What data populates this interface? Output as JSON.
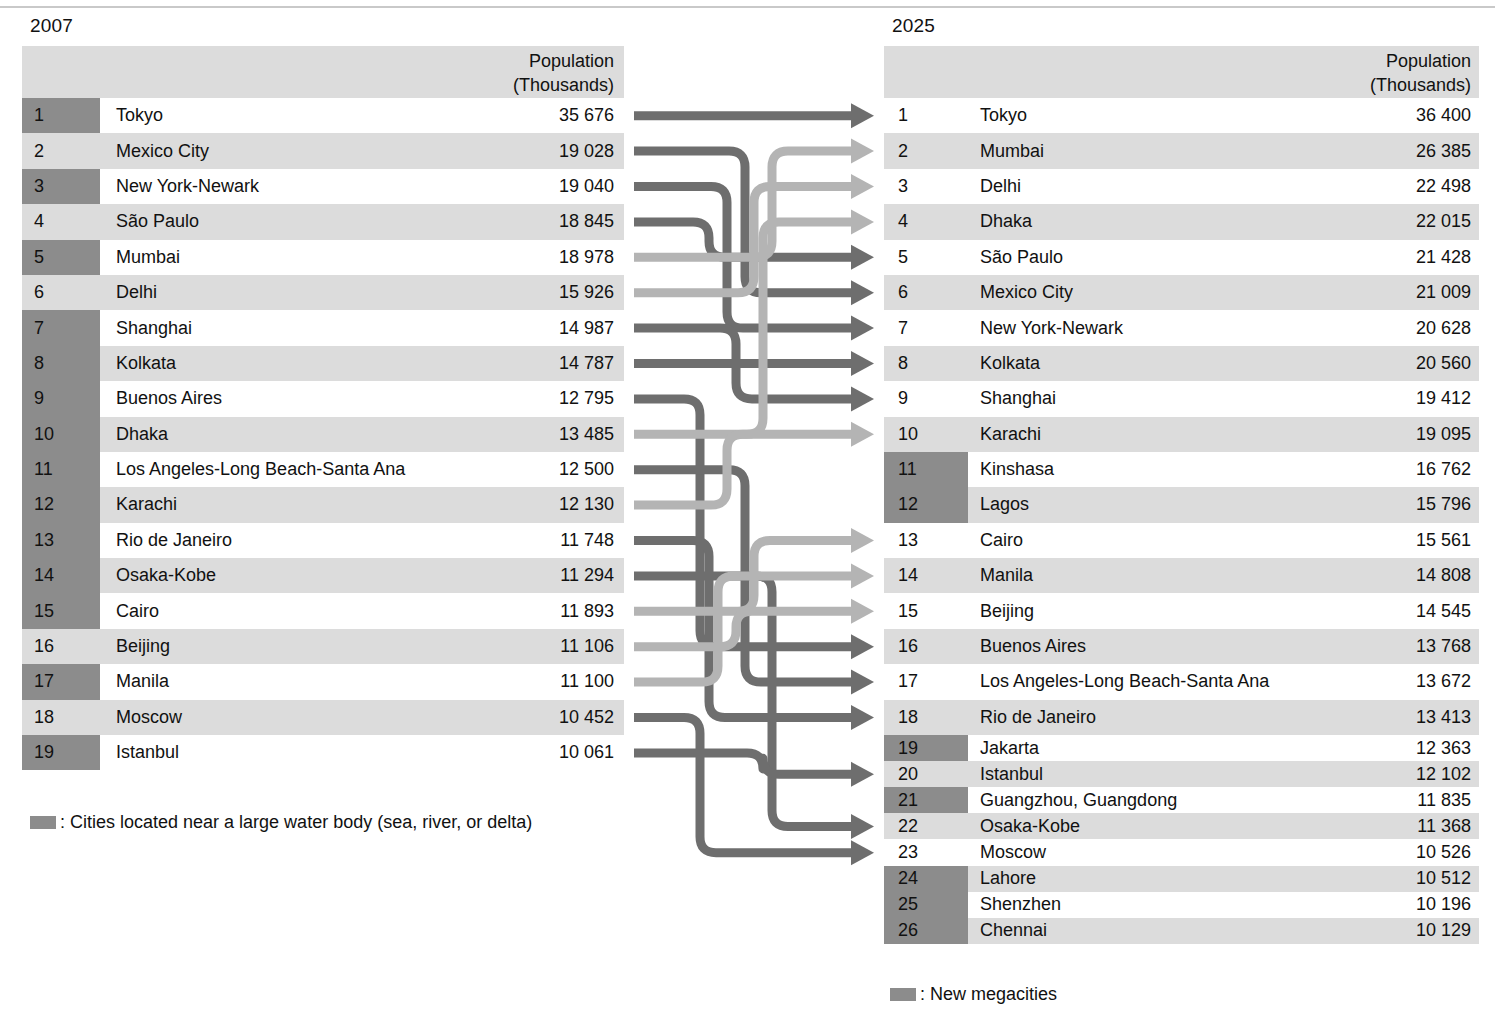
{
  "years": {
    "left": "2007",
    "right": "2025"
  },
  "headers": {
    "population_line1": "Population",
    "population_line2": "(Thousands)"
  },
  "colors": {
    "badge_shaded": "#8c8c8c",
    "row_even": "#dcdcdc",
    "row_odd": "#ffffff",
    "header_band": "#dcdcdc",
    "flow_dark": "#6e6e6e",
    "flow_light": "#b4b4b4",
    "rule": "#c9c9c9",
    "text": "#1a1a1a"
  },
  "legends": {
    "left": ": Cities located near a large water body (sea, river, or delta)",
    "right": ": New megacities"
  },
  "chart_data": {
    "type": "table",
    "title": "",
    "subtitle": "",
    "columns": [
      "Rank",
      "City",
      "Population (Thousands)"
    ],
    "left": {
      "year": "2007",
      "rows": [
        {
          "rank": "1",
          "city": "Tokyo",
          "pop": "35 676",
          "value": 35676,
          "shaded": true
        },
        {
          "rank": "2",
          "city": "Mexico City",
          "pop": "19 028",
          "value": 19028,
          "shaded": false
        },
        {
          "rank": "3",
          "city": "New York-Newark",
          "pop": "19 040",
          "value": 19040,
          "shaded": true
        },
        {
          "rank": "4",
          "city": "São Paulo",
          "pop": "18 845",
          "value": 18845,
          "shaded": false
        },
        {
          "rank": "5",
          "city": "Mumbai",
          "pop": "18 978",
          "value": 18978,
          "shaded": true
        },
        {
          "rank": "6",
          "city": "Delhi",
          "pop": "15 926",
          "value": 15926,
          "shaded": false
        },
        {
          "rank": "7",
          "city": "Shanghai",
          "pop": "14 987",
          "value": 14987,
          "shaded": true
        },
        {
          "rank": "8",
          "city": "Kolkata",
          "pop": "14 787",
          "value": 14787,
          "shaded": true
        },
        {
          "rank": "9",
          "city": "Buenos Aires",
          "pop": "12 795",
          "value": 12795,
          "shaded": true
        },
        {
          "rank": "10",
          "city": "Dhaka",
          "pop": "13 485",
          "value": 13485,
          "shaded": true
        },
        {
          "rank": "11",
          "city": "Los Angeles-Long Beach-Santa Ana",
          "pop": "12 500",
          "value": 12500,
          "shaded": true
        },
        {
          "rank": "12",
          "city": "Karachi",
          "pop": "12 130",
          "value": 12130,
          "shaded": true
        },
        {
          "rank": "13",
          "city": "Rio de Janeiro",
          "pop": "11 748",
          "value": 11748,
          "shaded": true
        },
        {
          "rank": "14",
          "city": "Osaka-Kobe",
          "pop": "11 294",
          "value": 11294,
          "shaded": true
        },
        {
          "rank": "15",
          "city": "Cairo",
          "pop": "11 893",
          "value": 11893,
          "shaded": true
        },
        {
          "rank": "16",
          "city": "Beijing",
          "pop": "11 106",
          "value": 11106,
          "shaded": false
        },
        {
          "rank": "17",
          "city": "Manila",
          "pop": "11 100",
          "value": 11100,
          "shaded": true
        },
        {
          "rank": "18",
          "city": "Moscow",
          "pop": "10 452",
          "value": 10452,
          "shaded": false
        },
        {
          "rank": "19",
          "city": "Istanbul",
          "pop": "10 061",
          "value": 10061,
          "shaded": true
        }
      ]
    },
    "right": {
      "year": "2025",
      "rows": [
        {
          "rank": "1",
          "city": "Tokyo",
          "pop": "36 400",
          "value": 36400,
          "shaded": false
        },
        {
          "rank": "2",
          "city": "Mumbai",
          "pop": "26 385",
          "value": 26385,
          "shaded": false
        },
        {
          "rank": "3",
          "city": "Delhi",
          "pop": "22 498",
          "value": 22498,
          "shaded": false
        },
        {
          "rank": "4",
          "city": "Dhaka",
          "pop": "22 015",
          "value": 22015,
          "shaded": false
        },
        {
          "rank": "5",
          "city": "São Paulo",
          "pop": "21 428",
          "value": 21428,
          "shaded": false
        },
        {
          "rank": "6",
          "city": "Mexico City",
          "pop": "21 009",
          "value": 21009,
          "shaded": false
        },
        {
          "rank": "7",
          "city": "New York-Newark",
          "pop": "20 628",
          "value": 20628,
          "shaded": false
        },
        {
          "rank": "8",
          "city": "Kolkata",
          "pop": "20 560",
          "value": 20560,
          "shaded": false
        },
        {
          "rank": "9",
          "city": "Shanghai",
          "pop": "19 412",
          "value": 19412,
          "shaded": false
        },
        {
          "rank": "10",
          "city": "Karachi",
          "pop": "19 095",
          "value": 19095,
          "shaded": false
        },
        {
          "rank": "11",
          "city": "Kinshasa",
          "pop": "16 762",
          "value": 16762,
          "shaded": true
        },
        {
          "rank": "12",
          "city": "Lagos",
          "pop": "15 796",
          "value": 15796,
          "shaded": true
        },
        {
          "rank": "13",
          "city": "Cairo",
          "pop": "15 561",
          "value": 15561,
          "shaded": false
        },
        {
          "rank": "14",
          "city": "Manila",
          "pop": "14 808",
          "value": 14808,
          "shaded": false
        },
        {
          "rank": "15",
          "city": "Beijing",
          "pop": "14 545",
          "value": 14545,
          "shaded": false
        },
        {
          "rank": "16",
          "city": "Buenos Aires",
          "pop": "13 768",
          "value": 13768,
          "shaded": false
        },
        {
          "rank": "17",
          "city": "Los Angeles-Long Beach-Santa Ana",
          "pop": "13 672",
          "value": 13672,
          "shaded": false
        },
        {
          "rank": "18",
          "city": "Rio de Janeiro",
          "pop": "13 413",
          "value": 13413,
          "shaded": false
        },
        {
          "rank": "19",
          "city": "Jakarta",
          "pop": "12 363",
          "value": 12363,
          "shaded": true
        },
        {
          "rank": "20",
          "city": "Istanbul",
          "pop": "12 102",
          "value": 12102,
          "shaded": false
        },
        {
          "rank": "21",
          "city": "Guangzhou, Guangdong",
          "pop": "11 835",
          "value": 11835,
          "shaded": true
        },
        {
          "rank": "22",
          "city": "Osaka-Kobe",
          "pop": "11 368",
          "value": 11368,
          "shaded": false
        },
        {
          "rank": "23",
          "city": "Moscow",
          "pop": "10 526",
          "value": 10526,
          "shaded": false
        },
        {
          "rank": "24",
          "city": "Lahore",
          "pop": "10 512",
          "value": 10512,
          "shaded": true
        },
        {
          "rank": "25",
          "city": "Shenzhen",
          "pop": "10 196",
          "value": 10196,
          "shaded": true
        },
        {
          "rank": "26",
          "city": "Chennai",
          "pop": "10 129",
          "value": 10129,
          "shaded": true
        }
      ]
    },
    "links": [
      {
        "from": "Tokyo",
        "from_rank": 1,
        "to_rank": 1,
        "shade": "dark"
      },
      {
        "from": "Mexico City",
        "from_rank": 2,
        "to_rank": 6,
        "shade": "dark"
      },
      {
        "from": "New York-Newark",
        "from_rank": 3,
        "to_rank": 7,
        "shade": "dark"
      },
      {
        "from": "São Paulo",
        "from_rank": 4,
        "to_rank": 5,
        "shade": "dark"
      },
      {
        "from": "Mumbai",
        "from_rank": 5,
        "to_rank": 2,
        "shade": "light"
      },
      {
        "from": "Delhi",
        "from_rank": 6,
        "to_rank": 3,
        "shade": "light"
      },
      {
        "from": "Shanghai",
        "from_rank": 7,
        "to_rank": 9,
        "shade": "dark"
      },
      {
        "from": "Kolkata",
        "from_rank": 8,
        "to_rank": 8,
        "shade": "dark"
      },
      {
        "from": "Buenos Aires",
        "from_rank": 9,
        "to_rank": 16,
        "shade": "dark"
      },
      {
        "from": "Dhaka",
        "from_rank": 10,
        "to_rank": 4,
        "shade": "light"
      },
      {
        "from": "Los Angeles-Long Beach-Santa Ana",
        "from_rank": 11,
        "to_rank": 17,
        "shade": "dark"
      },
      {
        "from": "Karachi",
        "from_rank": 12,
        "to_rank": 10,
        "shade": "light"
      },
      {
        "from": "Rio de Janeiro",
        "from_rank": 13,
        "to_rank": 18,
        "shade": "dark"
      },
      {
        "from": "Osaka-Kobe",
        "from_rank": 14,
        "to_rank": 22,
        "shade": "dark"
      },
      {
        "from": "Cairo",
        "from_rank": 15,
        "to_rank": 13,
        "shade": "light"
      },
      {
        "from": "Beijing",
        "from_rank": 16,
        "to_rank": 15,
        "shade": "light"
      },
      {
        "from": "Manila",
        "from_rank": 17,
        "to_rank": 14,
        "shade": "light"
      },
      {
        "from": "Moscow",
        "from_rank": 18,
        "to_rank": 23,
        "shade": "dark"
      },
      {
        "from": "Istanbul",
        "from_rank": 19,
        "to_rank": 20,
        "shade": "dark"
      }
    ]
  }
}
